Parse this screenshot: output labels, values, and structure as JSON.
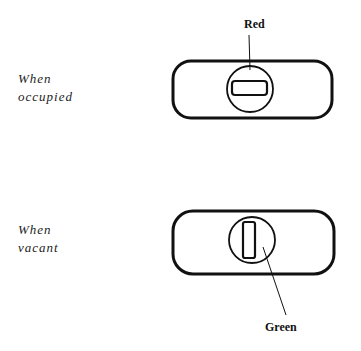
{
  "occupied": {
    "label_line1": "When",
    "label_line2": "occupied",
    "indicator_label": "Red",
    "indicator_color": "#cc0000"
  },
  "vacant": {
    "label_line1": "When",
    "label_line2": "vacant",
    "indicator_label": "Green",
    "indicator_color": "#008000"
  }
}
